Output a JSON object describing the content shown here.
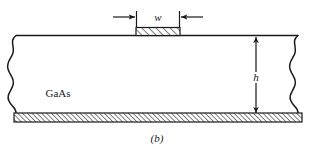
{
  "figure": {
    "caption": "(b)",
    "material_label": "GaAs",
    "width_dimension_label": "w",
    "height_dimension_label": "h",
    "colors": {
      "line": "#1a1a1a",
      "background": "#ffffff",
      "hatch": "#1a1a1a"
    },
    "elements": {
      "gate_name": "gate-contact",
      "substrate_name": "gaas-substrate",
      "back_contact_name": "back-contact-layer",
      "left_break_name": "left-break-line",
      "right_break_name": "right-break-line"
    }
  }
}
